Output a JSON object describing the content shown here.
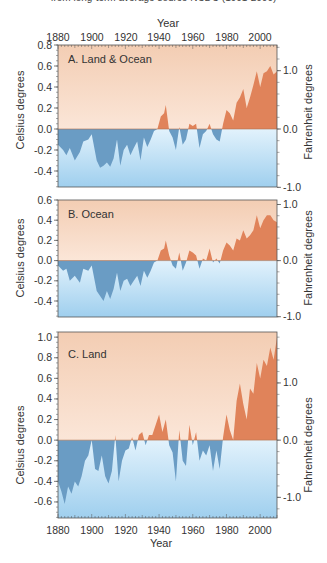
{
  "header": {
    "subtitle": "from long-term average source NCDC (1901-2000)"
  },
  "colors": {
    "warm_bg_top": "#f3cdb3",
    "warm_bg_bottom": "#fbe6d8",
    "cool_bg_top": "#dff0fb",
    "cool_bg_bottom": "#9fcfee",
    "warm_fill": "#e0835a",
    "cool_fill": "#6a9cc4",
    "frame": "#555555"
  },
  "chart_data": [
    {
      "type": "area",
      "title": "A. Land & Ocean",
      "xlabel": "Year",
      "ylabel": "Celsius degrees",
      "ylabel_right": "Fahrenheit degrees",
      "x_ticks": [
        1880,
        1900,
        1920,
        1940,
        1960,
        1980,
        2000
      ],
      "y_ticks": [
        0.8,
        0.6,
        0.4,
        0.2,
        0.0,
        -0.2,
        -0.4
      ],
      "y_ticks_right": [
        1.0,
        0.0,
        -1.0
      ],
      "ylim": [
        -0.55,
        0.8
      ],
      "x_axis_position": "top",
      "x": [
        1880,
        1883,
        1885,
        1887,
        1890,
        1893,
        1895,
        1898,
        1900,
        1903,
        1905,
        1907,
        1909,
        1911,
        1913,
        1915,
        1917,
        1919,
        1921,
        1923,
        1925,
        1927,
        1929,
        1931,
        1933,
        1935,
        1937,
        1939,
        1941,
        1943,
        1944,
        1946,
        1948,
        1950,
        1952,
        1954,
        1956,
        1958,
        1960,
        1962,
        1964,
        1966,
        1968,
        1970,
        1972,
        1974,
        1976,
        1978,
        1980,
        1982,
        1984,
        1986,
        1988,
        1990,
        1992,
        1994,
        1996,
        1998,
        2000,
        2002,
        2004,
        2006,
        2008,
        2010
      ],
      "values": [
        -0.15,
        -0.2,
        -0.25,
        -0.18,
        -0.3,
        -0.22,
        -0.12,
        -0.1,
        -0.05,
        -0.3,
        -0.37,
        -0.35,
        -0.32,
        -0.36,
        -0.28,
        -0.1,
        -0.35,
        -0.2,
        -0.15,
        -0.25,
        -0.18,
        -0.12,
        -0.3,
        -0.08,
        -0.17,
        -0.1,
        -0.02,
        0.0,
        0.12,
        0.15,
        0.23,
        -0.02,
        -0.08,
        -0.2,
        0.02,
        -0.15,
        -0.1,
        0.05,
        0.03,
        0.05,
        -0.18,
        -0.05,
        -0.02,
        0.05,
        -0.05,
        -0.1,
        -0.12,
        0.05,
        0.18,
        0.15,
        0.08,
        0.25,
        0.3,
        0.38,
        0.2,
        0.3,
        0.42,
        0.55,
        0.4,
        0.53,
        0.55,
        0.6,
        0.52,
        0.55
      ]
    },
    {
      "type": "area",
      "title": "B. Ocean",
      "xlabel": "",
      "ylabel": "Celsius degrees",
      "ylabel_right": "Fahrenheit degrees",
      "y_ticks": [
        0.6,
        0.4,
        0.2,
        0.0,
        -0.2,
        -0.4
      ],
      "y_ticks_right": [
        1.0,
        0.0,
        -1.0
      ],
      "ylim": [
        -0.55,
        0.6
      ],
      "x": [
        1880,
        1883,
        1885,
        1887,
        1890,
        1893,
        1895,
        1898,
        1900,
        1903,
        1905,
        1907,
        1909,
        1911,
        1913,
        1915,
        1917,
        1919,
        1921,
        1923,
        1925,
        1927,
        1929,
        1931,
        1933,
        1935,
        1937,
        1939,
        1941,
        1943,
        1944,
        1946,
        1948,
        1950,
        1952,
        1954,
        1956,
        1958,
        1960,
        1962,
        1964,
        1966,
        1968,
        1970,
        1972,
        1974,
        1976,
        1978,
        1980,
        1982,
        1984,
        1986,
        1988,
        1990,
        1992,
        1994,
        1996,
        1998,
        2000,
        2002,
        2004,
        2006,
        2008,
        2010
      ],
      "values": [
        -0.05,
        -0.1,
        -0.08,
        -0.2,
        -0.15,
        -0.22,
        -0.08,
        -0.1,
        -0.05,
        -0.3,
        -0.35,
        -0.4,
        -0.3,
        -0.38,
        -0.28,
        -0.12,
        -0.3,
        -0.2,
        -0.18,
        -0.25,
        -0.2,
        -0.15,
        -0.25,
        -0.1,
        -0.17,
        -0.1,
        -0.02,
        0.0,
        0.1,
        0.12,
        0.2,
        0.05,
        -0.05,
        -0.08,
        0.08,
        -0.1,
        -0.02,
        0.1,
        0.08,
        0.05,
        -0.08,
        0.02,
        0.0,
        0.12,
        -0.02,
        0.02,
        -0.03,
        0.1,
        0.18,
        0.15,
        0.1,
        0.22,
        0.2,
        0.3,
        0.22,
        0.25,
        0.3,
        0.45,
        0.32,
        0.4,
        0.45,
        0.45,
        0.4,
        0.38
      ]
    },
    {
      "type": "area",
      "title": "C. Land",
      "xlabel": "Year",
      "ylabel": "Celsius degrees",
      "ylabel_right": "Fahrenheit degrees",
      "x_ticks": [
        1880,
        1900,
        1920,
        1940,
        1960,
        1980,
        2000
      ],
      "y_ticks": [
        1.0,
        0.8,
        0.6,
        0.4,
        0.2,
        0.0,
        -0.2,
        -0.4,
        -0.6
      ],
      "y_ticks_right": [
        1.0,
        0.0,
        -1.0
      ],
      "ylim": [
        -0.7,
        1.05
      ],
      "x_axis_position": "bottom",
      "x": [
        1880,
        1882,
        1884,
        1886,
        1888,
        1890,
        1892,
        1894,
        1896,
        1898,
        1900,
        1902,
        1904,
        1906,
        1908,
        1910,
        1912,
        1914,
        1916,
        1918,
        1920,
        1922,
        1924,
        1926,
        1928,
        1930,
        1932,
        1934,
        1936,
        1938,
        1940,
        1942,
        1944,
        1946,
        1948,
        1950,
        1952,
        1954,
        1956,
        1958,
        1960,
        1962,
        1964,
        1966,
        1968,
        1970,
        1972,
        1974,
        1976,
        1978,
        1980,
        1982,
        1984,
        1986,
        1988,
        1990,
        1992,
        1994,
        1996,
        1998,
        2000,
        2002,
        2004,
        2006,
        2008,
        2010
      ],
      "values": [
        -0.4,
        -0.5,
        -0.62,
        -0.45,
        -0.52,
        -0.4,
        -0.45,
        -0.35,
        -0.2,
        -0.15,
        0.0,
        -0.28,
        -0.3,
        -0.15,
        -0.35,
        -0.42,
        -0.3,
        0.05,
        -0.4,
        -0.2,
        -0.1,
        -0.08,
        0.03,
        -0.1,
        0.05,
        0.08,
        -0.05,
        0.05,
        0.05,
        0.15,
        0.25,
        0.08,
        0.2,
        -0.05,
        -0.12,
        -0.4,
        0.1,
        -0.2,
        -0.25,
        0.15,
        -0.05,
        0.08,
        -0.2,
        -0.1,
        -0.15,
        -0.05,
        -0.3,
        -0.1,
        -0.28,
        0.03,
        0.25,
        0.1,
        0.0,
        0.38,
        0.55,
        0.35,
        0.2,
        0.5,
        0.45,
        0.75,
        0.6,
        0.78,
        0.72,
        0.9,
        0.78,
        1.0
      ]
    }
  ],
  "axes": {
    "year_label": "Year",
    "celsius_label": "Celsius degrees",
    "fahrenheit_label": "Fahrenheit degrees",
    "x_tick_labels": [
      "1880",
      "1900",
      "1920",
      "1940",
      "1960",
      "1980",
      "2000"
    ],
    "panels": [
      {
        "label": "A. Land & Ocean",
        "y_tick_labels": [
          "0.8",
          "0.6",
          "0.4",
          "0.2",
          "0.0",
          "-0.2",
          "-0.4"
        ],
        "f_tick_labels": [
          "1.0",
          "0.0",
          "-1.0"
        ]
      },
      {
        "label": "B. Ocean",
        "y_tick_labels": [
          "0.6",
          "0.4",
          "0.2",
          "0.0",
          "-0.2",
          "-0.4"
        ],
        "f_tick_labels": [
          "1.0",
          "0.0",
          "-1.0"
        ]
      },
      {
        "label": "C. Land",
        "y_tick_labels": [
          "1.0",
          "0.8",
          "0.6",
          "0.4",
          "0.2",
          "0.0",
          "-0.2",
          "-0.4",
          "-0.6"
        ],
        "f_tick_labels": [
          "1.0",
          "0.0",
          "-1.0"
        ]
      }
    ]
  }
}
